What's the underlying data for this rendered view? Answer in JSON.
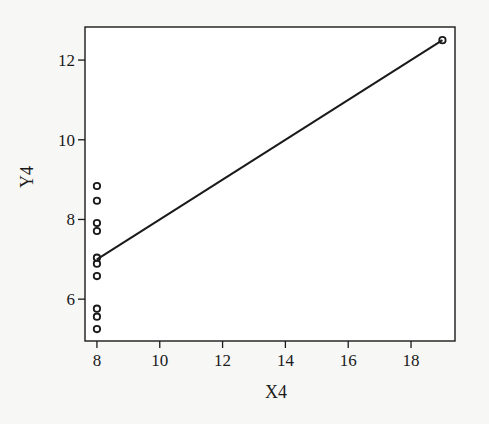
{
  "chart_data": {
    "type": "scatter",
    "title": "",
    "xlabel": "X4",
    "ylabel": "Y4",
    "xlim": [
      7.62,
      19.4
    ],
    "ylim": [
      4.95,
      12.83
    ],
    "xticks": [
      8,
      10,
      12,
      14,
      16,
      18
    ],
    "yticks": [
      6,
      8,
      10,
      12
    ],
    "grid": false,
    "legend": null,
    "series": [
      {
        "name": "Y4",
        "marker": "open-circle",
        "x": [
          8,
          8,
          8,
          8,
          8,
          8,
          8,
          8,
          8,
          8,
          19
        ],
        "y": [
          8.84,
          8.47,
          7.91,
          7.71,
          7.04,
          6.89,
          6.58,
          5.76,
          5.56,
          5.25,
          12.5
        ]
      }
    ],
    "fit_line": {
      "name": "regression-line",
      "intercept": 3.0,
      "slope": 0.5,
      "x_range": [
        8,
        19
      ]
    }
  },
  "colors": {
    "background": "#f7f7f5",
    "ink": "#1a1a1a"
  }
}
